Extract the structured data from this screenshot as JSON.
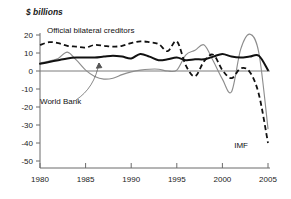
{
  "chart_data": {
    "type": "line",
    "title": "$ billions",
    "xlabel": "",
    "ylabel": "$ billions",
    "xlim": [
      1980,
      2005
    ],
    "ylim": [
      -50,
      25
    ],
    "grid": false,
    "legend_position": "inline-annotations",
    "x_ticks": [
      "1980",
      "1985",
      "1990",
      "1995",
      "2000",
      "2005"
    ],
    "x_tick_values": [
      1980,
      1985,
      1990,
      1995,
      2000,
      2005
    ],
    "y_ticks": [
      "20",
      "10",
      "0",
      "-10",
      "-20",
      "-30",
      "-40",
      "-50"
    ],
    "y_tick_values": [
      20,
      10,
      0,
      -10,
      -20,
      -30,
      -40,
      -50
    ],
    "annotations": [
      {
        "text": "Official bilateral creditors",
        "series": "Official bilateral creditors"
      },
      {
        "text": "World Bank",
        "series": "World Bank"
      },
      {
        "text": "IMF",
        "series": "IMF"
      }
    ],
    "x": [
      1980,
      1981,
      1982,
      1983,
      1984,
      1985,
      1986,
      1987,
      1988,
      1989,
      1990,
      1991,
      1992,
      1993,
      1994,
      1995,
      1996,
      1997,
      1998,
      1999,
      2000,
      2001,
      2002,
      2003,
      2004,
      2005
    ],
    "series": [
      {
        "name": "Official bilateral creditors",
        "style": "dashed",
        "color": "#111111",
        "values": [
          14.5,
          16.0,
          15.5,
          14.0,
          13.5,
          13.0,
          14.5,
          14.0,
          13.5,
          14.0,
          15.5,
          16.5,
          16.0,
          15.0,
          11.0,
          16.5,
          3.0,
          -3.0,
          5.5,
          9.0,
          0.5,
          -4.0,
          1.5,
          -0.5,
          -13.0,
          -40.0
        ]
      },
      {
        "name": "World Bank",
        "style": "thin-gray",
        "color": "#8d8d8d",
        "values": [
          4.5,
          5.5,
          7.0,
          10.5,
          6.0,
          0.5,
          -3.0,
          -4.5,
          -4.0,
          -2.0,
          -0.5,
          0.5,
          1.0,
          1.0,
          0.0,
          0.5,
          9.0,
          11.5,
          14.5,
          5.5,
          -4.5,
          -11.5,
          12.0,
          20.5,
          10.0,
          -32.0
        ]
      },
      {
        "name": "IMF",
        "style": "thick-solid",
        "color": "#111111",
        "values": [
          4.0,
          5.0,
          6.0,
          7.0,
          7.5,
          7.5,
          7.5,
          8.0,
          8.5,
          8.0,
          7.0,
          9.5,
          8.0,
          6.0,
          6.5,
          7.5,
          6.0,
          6.5,
          6.5,
          8.0,
          9.5,
          8.0,
          7.5,
          8.0,
          8.5,
          0.5
        ]
      }
    ]
  },
  "labels": {
    "y_axis_title": "$ billions",
    "official_bilateral": "Official bilateral creditors",
    "world_bank": "World Bank",
    "imf": "IMF"
  }
}
